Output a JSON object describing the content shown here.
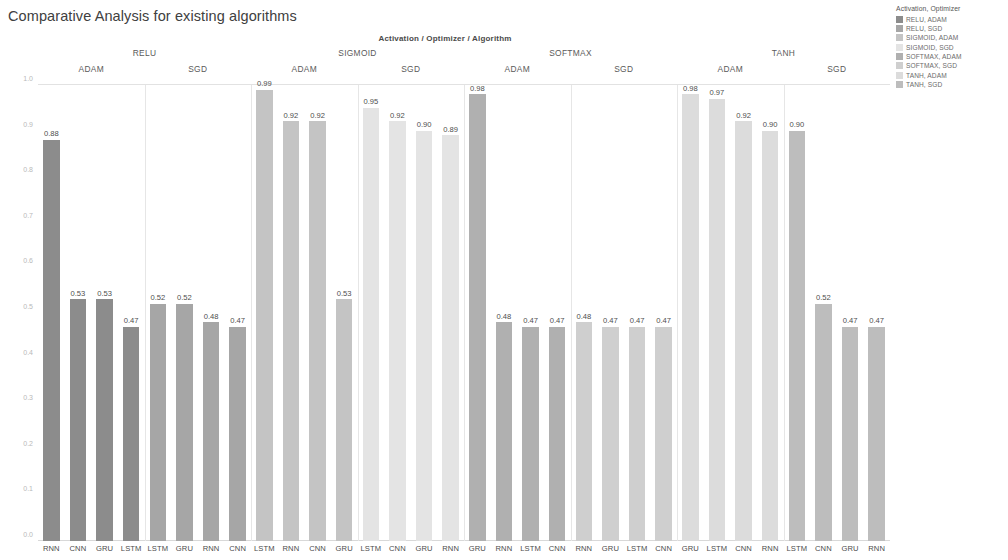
{
  "title": "Comparative Analysis for existing algorithms",
  "legend": {
    "title": "Activation, Optimizer",
    "items": [
      {
        "label": "RELU, ADAM",
        "color": "#8c8c8c"
      },
      {
        "label": "RELU, SGD",
        "color": "#a6a6a6"
      },
      {
        "label": "SIGMOID, ADAM",
        "color": "#c4c4c4"
      },
      {
        "label": "SIGMOID, SGD",
        "color": "#e4e4e4"
      },
      {
        "label": "SOFTMAX, ADAM",
        "color": "#b0b0b0"
      },
      {
        "label": "SOFTMAX, SGD",
        "color": "#cfcfcf"
      },
      {
        "label": "TANH, ADAM",
        "color": "#dcdcdc"
      },
      {
        "label": "TANH, SGD",
        "color": "#bdbdbd"
      }
    ]
  },
  "band_title": "Activation / Optimizer / Algorithm",
  "y_axis_label": "Accuracy",
  "chart_data": {
    "type": "bar",
    "title": "Comparative Analysis for existing algorithms",
    "xlabel": "Activation / Optimizer / Algorithm",
    "ylabel": "Accuracy",
    "ylim": [
      0.0,
      1.0
    ],
    "yticks": [
      "0.0",
      "0.1",
      "0.2",
      "0.3",
      "0.4",
      "0.5",
      "0.6",
      "0.7",
      "0.8",
      "0.9",
      "1.0"
    ],
    "grid": false,
    "legend_position": "top-right",
    "groups": [
      {
        "activation": "RELU",
        "optimizers": [
          {
            "optimizer": "ADAM",
            "color": "#8c8c8c",
            "categories": [
              "RNN",
              "CNN",
              "GRU",
              "LSTM"
            ],
            "values": [
              0.88,
              0.53,
              0.53,
              0.47
            ]
          },
          {
            "optimizer": "SGD",
            "color": "#a6a6a6",
            "categories": [
              "LSTM",
              "GRU",
              "RNN",
              "CNN"
            ],
            "values": [
              0.52,
              0.52,
              0.48,
              0.47
            ]
          }
        ]
      },
      {
        "activation": "SIGMOID",
        "optimizers": [
          {
            "optimizer": "ADAM",
            "color": "#c4c4c4",
            "categories": [
              "LSTM",
              "RNN",
              "CNN",
              "GRU"
            ],
            "values": [
              0.99,
              0.92,
              0.92,
              0.53
            ]
          },
          {
            "optimizer": "SGD",
            "color": "#e4e4e4",
            "categories": [
              "LSTM",
              "CNN",
              "GRU",
              "RNN"
            ],
            "values": [
              0.95,
              0.92,
              0.9,
              0.89
            ]
          }
        ]
      },
      {
        "activation": "SOFTMAX",
        "optimizers": [
          {
            "optimizer": "ADAM",
            "color": "#b0b0b0",
            "categories": [
              "GRU",
              "RNN",
              "LSTM",
              "CNN"
            ],
            "values": [
              0.98,
              0.48,
              0.47,
              0.47
            ]
          },
          {
            "optimizer": "SGD",
            "color": "#cfcfcf",
            "categories": [
              "RNN",
              "GRU",
              "LSTM",
              "CNN"
            ],
            "values": [
              0.48,
              0.47,
              0.47,
              0.47
            ]
          }
        ]
      },
      {
        "activation": "TANH",
        "optimizers": [
          {
            "optimizer": "ADAM",
            "color": "#dcdcdc",
            "categories": [
              "GRU",
              "LSTM",
              "CNN",
              "RNN"
            ],
            "values": [
              0.98,
              0.97,
              0.92,
              0.9
            ]
          },
          {
            "optimizer": "SGD",
            "color": "#bdbdbd",
            "categories": [
              "LSTM",
              "CNN",
              "GRU",
              "RNN"
            ],
            "values": [
              0.9,
              0.52,
              0.47,
              0.47
            ]
          }
        ]
      }
    ]
  }
}
